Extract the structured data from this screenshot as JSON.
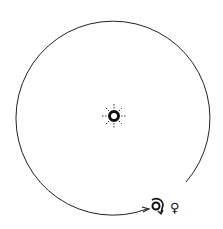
{
  "diagram": {
    "type": "orbit",
    "center_symbol": "sun-icon",
    "orbit_direction": "counter-clockwise",
    "labels": {
      "orbiting_body_symbol": "☊",
      "venus_symbol": "♀"
    },
    "colors": {
      "stroke": "#222222",
      "background": "#ffffff"
    }
  }
}
